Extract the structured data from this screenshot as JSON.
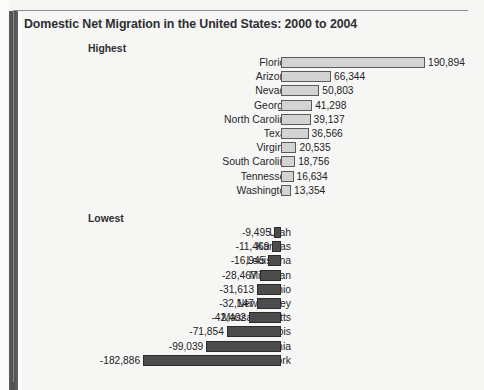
{
  "figure": {
    "title": "Domestic Net Migration in the United States: 2000 to 2004",
    "group_highest_label": "Highest",
    "group_lowest_label": "Lowest"
  },
  "colors": {
    "positive_bar_fill": "#d3d3d3",
    "positive_bar_border": "#5a5a5a",
    "negative_bar_fill": "#4c4c4c",
    "negative_bar_border": "#2b2b2b",
    "text": "#26262a",
    "page_background": "#f6f6f4"
  },
  "chart_data": {
    "type": "bar",
    "orientation": "horizontal",
    "title": "Domestic Net Migration in the United States: 2000 to 2004",
    "xlabel": "",
    "ylabel": "",
    "grid": false,
    "legend": "none",
    "xlim": [
      -182886,
      190894
    ],
    "zero_baseline": true,
    "groups": [
      {
        "name": "Highest",
        "categories": [
          "Florida",
          "Arizona",
          "Nevada",
          "Georgia",
          "North Carolina",
          "Texas",
          "Virginia",
          "South Carolina",
          "Tennessee",
          "Washington"
        ],
        "values": [
          190894,
          66344,
          50803,
          41298,
          39137,
          36566,
          20535,
          18756,
          16634,
          13354
        ],
        "value_labels": [
          "190,894",
          "66,344",
          "50,803",
          "41,298",
          "39,137",
          "36,566",
          "20,535",
          "18,756",
          "16,634",
          "13,354"
        ]
      },
      {
        "name": "Lowest",
        "categories": [
          "Utah",
          "Kansas",
          "Louisiana",
          "Michigan",
          "Ohio",
          "New Jersey",
          "Massachusetts",
          "Illinois",
          "California",
          "New York"
        ],
        "values": [
          -9495,
          -11469,
          -16945,
          -28467,
          -31613,
          -32147,
          -42402,
          -71854,
          -99039,
          -182886
        ],
        "value_labels": [
          "-9,495",
          "-11,469",
          "-16,945",
          "-28,467",
          "-31,613",
          "-32,147",
          "-42,402",
          "-71,854",
          "-99,039",
          "-182,886"
        ]
      }
    ]
  }
}
